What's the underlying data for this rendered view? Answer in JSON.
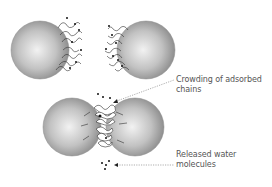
{
  "diagram": {
    "type": "colloid steric stabilisation / bridging illustration",
    "panels": [
      {
        "name": "separated-particles",
        "description": "Two spheres with adsorbed polymer chains, apart"
      },
      {
        "name": "approached-particles",
        "description": "Two spheres in close contact with crowded chains"
      }
    ],
    "labels": {
      "crowding_line1": "Crowding of adsorbed",
      "crowding_line2": "chains",
      "water_line1": "Released water",
      "water_line2": "molecules"
    },
    "colors": {
      "sphere_light": "#eeeeee",
      "sphere_dark": "#8a8a8a",
      "chain": "#333333",
      "dot": "#111111",
      "leader": "#777777",
      "text": "#555555"
    }
  }
}
